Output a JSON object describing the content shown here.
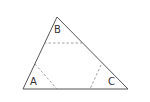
{
  "diagram": {
    "type": "triangle-with-corner-cuts",
    "colors": {
      "edge": "#555555",
      "dashed": "#888888",
      "label": "#333333"
    },
    "vertices": {
      "A": {
        "label": "A",
        "x": 23,
        "y": 89
      },
      "B": {
        "label": "B",
        "x": 57,
        "y": 17
      },
      "C": {
        "label": "C",
        "x": 128,
        "y": 89
      }
    },
    "labels": [
      {
        "id": "A",
        "text": "A",
        "x": 30,
        "y": 85
      },
      {
        "id": "B",
        "text": "B",
        "x": 54,
        "y": 33
      },
      {
        "id": "C",
        "text": "C",
        "x": 108,
        "y": 85
      }
    ],
    "dashed_cuts": [
      {
        "corner": "B",
        "x1": 44,
        "y1": 43,
        "x2": 82,
        "y2": 43
      },
      {
        "corner": "A",
        "x1": 35,
        "y1": 64,
        "x2": 57,
        "y2": 89
      },
      {
        "corner": "C",
        "x1": 101,
        "y1": 65,
        "x2": 90,
        "y2": 89
      }
    ]
  }
}
